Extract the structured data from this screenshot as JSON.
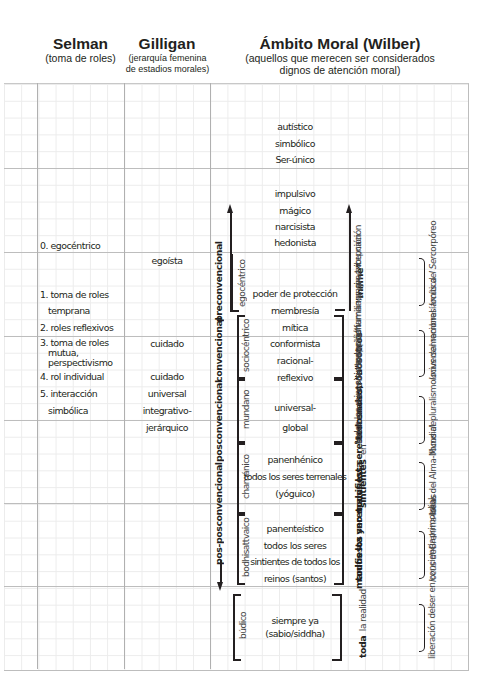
{
  "header": {
    "selman": {
      "title": "Selman",
      "subtitle": "(toma de roles)"
    },
    "gilligan": {
      "title": "Gilligan",
      "subtitle_1": "(jerarquía femenina",
      "subtitle_2": "de estadios morales)"
    },
    "wilber": {
      "title": "Ámbito Moral (Wilber)",
      "subtitle_1": "(aquellos que merecen ser considerados",
      "subtitle_2": "dignos de atención moral)"
    }
  },
  "selman": {
    "items": [
      "0. egocéntrico",
      "1. toma de roles",
      "temprana",
      "2. roles reflexivos",
      "3. toma de roles",
      "mutua,",
      "perspectivismo",
      "4. rol individual",
      "5. interacción",
      "simbólica"
    ]
  },
  "gilligan": {
    "items": [
      "egoísta",
      "cuidado",
      "cuidado",
      "universal",
      "integrativo-",
      "jerárquico"
    ]
  },
  "levels": {
    "preconventional": "preconvencional",
    "conventional": "convencional",
    "postconventional": "posconvencional",
    "post_postconventional": "pos-posconvencional"
  },
  "stages": [
    "egocéntrico",
    "sociocéntrico",
    "mundano",
    "chamánico",
    "bodhisattvaico",
    "búdico"
  ],
  "wilber_center": {
    "row1": [
      "autístico",
      "simbólico",
      "Ser-único"
    ],
    "row2": [
      "impulsivo",
      "mágico",
      "narcisista",
      "hedonista"
    ],
    "row3": [
      "poder de protección",
      "membresía"
    ],
    "row4": [
      "mítica",
      "conformista",
      "racional-",
      "reflexivo"
    ],
    "row5": [
      "universal-",
      "global"
    ],
    "row6": [
      "panenhénico",
      "todos los seres terrenales",
      "(yóguico)"
    ],
    "row7": [
      "panenteístico",
      "todos los seres",
      "sintientes de todos los",
      "reinos (santos)"
    ],
    "row8": [
      "siempre ya",
      "(sabio/siddha)"
    ]
  },
  "scope": {
    "mi_me": "\"mí/me\"",
    "nosotros_bold": "\"nosotros\"",
    "nosotros_rest": [
      "familia,",
      "grupo,",
      "tribu,",
      "nación"
    ],
    "todos_nosotros_bold": [
      "\"todos",
      "nosotros\""
    ],
    "todos_nosotros_rest": [
      "todos los",
      "humanos,",
      "sin excepción"
    ],
    "terrenales_bold": [
      "todos los seres",
      "terrenales,"
    ],
    "terrenales_rest": "sin excepción",
    "sintientes_bold": [
      "todos los seres",
      "sintientes"
    ],
    "sintientes_en": "en",
    "sintientes_rest": [
      "todos los reinos,",
      "sin excepción"
    ],
    "realidad_bold_1": "toda",
    "realidad_rest": "la realidad",
    "realidad_bold": [
      "manifiesta y",
      "no manifiesta"
    ]
  },
  "locus": [
    [
      "locus del Ser",
      "corpóreo"
    ],
    [
      "locus de",
      "membresía",
      "mítica"
    ],
    [
      "locus de",
      "pluralismo",
      "universal racional"
    ],
    [
      "locus del Alma-",
      "Mundial"
    ],
    [
      "locus de",
      "Brahma-lokas"
    ],
    [
      "liberación del",
      "ser en conciencia",
      "primordial"
    ]
  ]
}
